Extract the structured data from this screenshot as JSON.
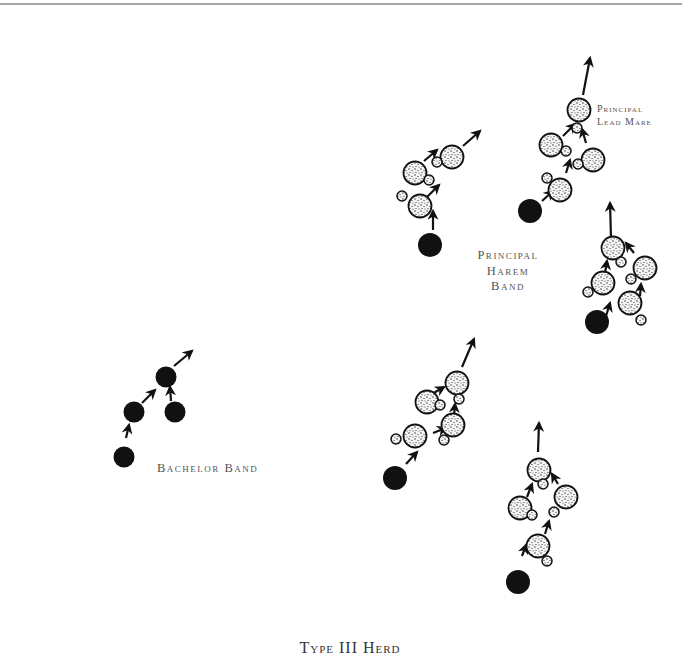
{
  "title": "Type III Herd",
  "labels": {
    "bachelor_band": "Bachelor Band",
    "principal_harem_band": [
      "Principal",
      "Harem",
      "Band"
    ],
    "principal_lead_mare": [
      "Principal",
      "Lead Mare"
    ]
  },
  "legend_semantics": {
    "stallion": "solid black circle",
    "mare": "stippled large circle",
    "foal": "stippled small circle",
    "movement": "arrow"
  },
  "colors": {
    "ink": "#111111",
    "stipple_fill": "#f4f4f4",
    "rule": "#8a8a8a",
    "label_text": "#555555"
  },
  "groups": [
    {
      "name": "harem-band-upper-left",
      "stallions": [
        [
          430,
          245
        ]
      ],
      "mares": [
        [
          420,
          206
        ],
        [
          415,
          173
        ],
        [
          452,
          157
        ]
      ],
      "foals": [
        [
          402,
          196
        ],
        [
          429,
          180
        ],
        [
          437,
          162
        ]
      ],
      "arrows": [
        [
          433,
          230,
          433,
          211
        ],
        [
          427,
          197,
          439,
          185
        ],
        [
          424,
          161,
          437,
          150
        ],
        [
          463,
          146,
          480,
          131
        ]
      ]
    },
    {
      "name": "harem-band-principal",
      "stallions": [
        [
          530,
          211
        ]
      ],
      "mares": [
        [
          560,
          190
        ],
        [
          551,
          145
        ],
        [
          593,
          160
        ],
        [
          579,
          110
        ]
      ],
      "foals": [
        [
          547,
          178
        ],
        [
          566,
          151
        ],
        [
          578,
          164
        ],
        [
          577,
          128
        ]
      ],
      "arrows": [
        [
          542,
          201,
          553,
          191
        ],
        [
          566,
          173,
          570,
          160
        ],
        [
          563,
          136,
          575,
          124
        ],
        [
          586,
          143,
          582,
          129
        ],
        [
          583,
          95,
          590,
          58
        ]
      ]
    },
    {
      "name": "harem-band-right",
      "stallions": [
        [
          597,
          322
        ]
      ],
      "mares": [
        [
          630,
          303
        ],
        [
          603,
          283
        ],
        [
          645,
          268
        ],
        [
          613,
          248
        ]
      ],
      "foals": [
        [
          641,
          320
        ],
        [
          588,
          292
        ],
        [
          631,
          279
        ],
        [
          621,
          262
        ]
      ],
      "arrows": [
        [
          606,
          316,
          610,
          303
        ],
        [
          640,
          296,
          641,
          284
        ],
        [
          605,
          273,
          607,
          261
        ],
        [
          634,
          253,
          626,
          243
        ],
        [
          611,
          238,
          610,
          203
        ]
      ]
    },
    {
      "name": "bachelor-band",
      "stallions": [
        [
          124,
          457
        ],
        [
          134,
          412
        ],
        [
          175,
          412
        ],
        [
          166,
          377
        ]
      ],
      "mares": [],
      "foals": [],
      "arrows": [
        [
          126,
          438,
          129,
          425
        ],
        [
          142,
          403,
          155,
          390
        ],
        [
          171,
          401,
          170,
          387
        ],
        [
          174,
          366,
          192,
          351
        ]
      ]
    },
    {
      "name": "harem-band-lower-middle",
      "stallions": [
        [
          395,
          478
        ]
      ],
      "mares": [
        [
          415,
          436
        ],
        [
          453,
          425
        ],
        [
          427,
          402
        ],
        [
          457,
          383
        ]
      ],
      "foals": [
        [
          396,
          439
        ],
        [
          444,
          440
        ],
        [
          440,
          405
        ],
        [
          459,
          399
        ]
      ],
      "arrows": [
        [
          406,
          464,
          417,
          452
        ],
        [
          433,
          433,
          446,
          428
        ],
        [
          454,
          416,
          455,
          404
        ],
        [
          432,
          394,
          444,
          387
        ],
        [
          462,
          367,
          474,
          339
        ]
      ]
    },
    {
      "name": "harem-band-lower-right",
      "stallions": [
        [
          518,
          582
        ]
      ],
      "mares": [
        [
          538,
          546
        ],
        [
          566,
          497
        ],
        [
          520,
          508
        ],
        [
          539,
          470
        ]
      ],
      "foals": [
        [
          547,
          561
        ],
        [
          554,
          512
        ],
        [
          532,
          515
        ],
        [
          543,
          484
        ]
      ],
      "arrows": [
        [
          522,
          556,
          526,
          545
        ],
        [
          545,
          534,
          549,
          521
        ],
        [
          527,
          497,
          532,
          484
        ],
        [
          558,
          484,
          552,
          474
        ],
        [
          538,
          452,
          539,
          423
        ]
      ]
    }
  ],
  "sizes": {
    "stallion_r": 12,
    "bachelor_r": 10.5,
    "mare_r": 11.5,
    "foal_r": 5
  }
}
